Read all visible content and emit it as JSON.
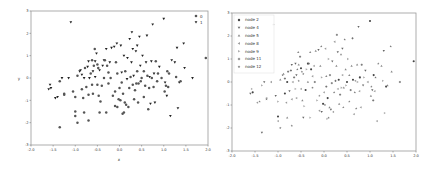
{
  "chart_data": [
    {
      "type": "scatter",
      "title": "",
      "xlabel": "x",
      "ylabel": "y",
      "xlim": [
        -2.0,
        2.0
      ],
      "ylim": [
        -3,
        3
      ],
      "xticks": [
        "-2.0",
        "-1.5",
        "-1.0",
        "-0.5",
        "0.0",
        "0.5",
        "1.0",
        "1.5",
        "2.0"
      ],
      "yticks": [
        "-3",
        "-2",
        "-1",
        "0",
        "1",
        "2",
        "3"
      ],
      "grid": false,
      "legend_position": "upper right",
      "series": [
        {
          "name": "0",
          "marker": "circle",
          "color": "#555555"
        },
        {
          "name": "1",
          "marker": "triangle-down",
          "color": "#222222"
        }
      ]
    },
    {
      "type": "scatter",
      "title": "",
      "xlabel": "",
      "ylabel": "",
      "xlim": [
        -2.0,
        2.0
      ],
      "ylim": [
        -3,
        3
      ],
      "xticks": [
        "-2.0",
        "-1.5",
        "-1.0",
        "-0.5",
        "0.0",
        "0.5",
        "1.0",
        "1.5",
        "2.0"
      ],
      "yticks": [
        "-3",
        "-2",
        "-1",
        "0",
        "1",
        "2",
        "3"
      ],
      "grid": false,
      "legend_position": "upper left",
      "series": [
        {
          "name": "node 2",
          "marker": "circle",
          "color": "#444444"
        },
        {
          "name": "node 4",
          "marker": "triangle-down",
          "color": "#666666"
        },
        {
          "name": "node 5",
          "marker": "triangle-up",
          "color": "#888888"
        },
        {
          "name": "node 8",
          "marker": "triangle-left",
          "color": "#999999"
        },
        {
          "name": "node 9",
          "marker": "triangle-right",
          "color": "#aaaaaa"
        },
        {
          "name": "node 11",
          "marker": "plus",
          "color": "#666666"
        },
        {
          "name": "node 12",
          "marker": "star",
          "color": "#777777"
        }
      ]
    }
  ],
  "points": [
    [
      -1.6,
      -0.5,
      1
    ],
    [
      -1.57,
      -0.3,
      1
    ],
    [
      -1.55,
      -0.45,
      1
    ],
    [
      -1.45,
      -0.9,
      1
    ],
    [
      -1.4,
      -0.85,
      1
    ],
    [
      -1.35,
      -2.2,
      0
    ],
    [
      -1.35,
      -0.15,
      0
    ],
    [
      -1.3,
      0.0,
      1
    ],
    [
      -1.25,
      -0.7,
      0
    ],
    [
      -1.25,
      -0.75,
      0
    ],
    [
      -1.15,
      -0.0,
      1
    ],
    [
      -1.1,
      2.5,
      1
    ],
    [
      -1.05,
      -0.6,
      0
    ],
    [
      -1.0,
      -0.85,
      0
    ],
    [
      -1.0,
      -1.5,
      0
    ],
    [
      -1.0,
      -1.7,
      0
    ],
    [
      -0.95,
      -2.0,
      0
    ],
    [
      -0.95,
      0.1,
      0
    ],
    [
      -0.9,
      0.3,
      1
    ],
    [
      -0.88,
      0.35,
      1
    ],
    [
      -0.85,
      0.15,
      1
    ],
    [
      -0.85,
      -0.5,
      0
    ],
    [
      -0.82,
      -0.9,
      0
    ],
    [
      -0.8,
      0.0,
      1
    ],
    [
      -0.8,
      -1.55,
      0
    ],
    [
      -0.78,
      0.45,
      0
    ],
    [
      -0.75,
      -0.4,
      0
    ],
    [
      -0.72,
      0.5,
      1
    ],
    [
      -0.7,
      0.75,
      1
    ],
    [
      -0.7,
      -0.75,
      0
    ],
    [
      -0.7,
      -1.9,
      0
    ],
    [
      -0.68,
      0.0,
      1
    ],
    [
      -0.65,
      0.2,
      0
    ],
    [
      -0.62,
      0.8,
      0
    ],
    [
      -0.62,
      -0.3,
      0
    ],
    [
      -0.6,
      0.3,
      1
    ],
    [
      -0.6,
      -0.7,
      0
    ],
    [
      -0.58,
      0.55,
      0
    ],
    [
      -0.56,
      1.3,
      0
    ],
    [
      -0.55,
      0.05,
      1
    ],
    [
      -0.55,
      0.75,
      1
    ],
    [
      -0.52,
      1.1,
      1
    ],
    [
      -0.5,
      0.6,
      0
    ],
    [
      -0.5,
      -0.3,
      0
    ],
    [
      -0.48,
      0.45,
      0
    ],
    [
      -0.47,
      -0.8,
      0
    ],
    [
      -0.45,
      0.35,
      1
    ],
    [
      -0.45,
      -1.55,
      0
    ],
    [
      -0.43,
      -1.05,
      0
    ],
    [
      -0.4,
      -0.35,
      0
    ],
    [
      -0.38,
      0.55,
      1
    ],
    [
      -0.35,
      0.8,
      1
    ],
    [
      -0.35,
      0.0,
      0
    ],
    [
      -0.33,
      0.8,
      0
    ],
    [
      -0.3,
      1.3,
      1
    ],
    [
      -0.3,
      -1.55,
      0
    ],
    [
      -0.28,
      0.55,
      0
    ],
    [
      -0.25,
      0.25,
      0
    ],
    [
      -0.25,
      -0.25,
      0
    ],
    [
      -0.22,
      0.7,
      1
    ],
    [
      -0.2,
      0.0,
      0
    ],
    [
      -0.18,
      1.35,
      1
    ],
    [
      -0.15,
      -0.8,
      0
    ],
    [
      -0.12,
      1.4,
      1
    ],
    [
      -0.1,
      -1.25,
      0
    ],
    [
      -0.1,
      -0.6,
      0
    ],
    [
      -0.08,
      0.7,
      0
    ],
    [
      -0.06,
      1.55,
      1
    ],
    [
      -0.05,
      -1.3,
      0
    ],
    [
      -0.05,
      0.2,
      0
    ],
    [
      -0.02,
      -0.95,
      0
    ],
    [
      0.0,
      -0.45,
      0
    ],
    [
      0.02,
      -1.0,
      0
    ],
    [
      0.03,
      1.45,
      1
    ],
    [
      0.05,
      -0.2,
      0
    ],
    [
      0.05,
      0.25,
      1
    ],
    [
      0.07,
      -1.6,
      0
    ],
    [
      0.08,
      -0.7,
      0
    ],
    [
      0.1,
      1.0,
      1
    ],
    [
      0.1,
      -1.55,
      0
    ],
    [
      0.12,
      -1.1,
      0
    ],
    [
      0.13,
      0.3,
      0
    ],
    [
      0.15,
      -1.2,
      0
    ],
    [
      0.17,
      -0.05,
      1
    ],
    [
      0.18,
      0.9,
      1
    ],
    [
      0.2,
      -1.3,
      0
    ],
    [
      0.22,
      -0.45,
      0
    ],
    [
      0.23,
      1.75,
      1
    ],
    [
      0.25,
      0.05,
      0
    ],
    [
      0.27,
      0.7,
      1
    ],
    [
      0.28,
      2.05,
      1
    ],
    [
      0.3,
      1.3,
      1
    ],
    [
      0.3,
      -0.3,
      0
    ],
    [
      0.32,
      0.1,
      1
    ],
    [
      0.33,
      -0.95,
      0
    ],
    [
      0.35,
      -0.55,
      0
    ],
    [
      0.37,
      1.2,
      1
    ],
    [
      0.38,
      -0.25,
      0
    ],
    [
      0.4,
      1.45,
      1
    ],
    [
      0.4,
      0.3,
      0
    ],
    [
      0.42,
      -1.1,
      0
    ],
    [
      0.43,
      -0.25,
      0
    ],
    [
      0.45,
      1.85,
      1
    ],
    [
      0.47,
      0.55,
      1
    ],
    [
      0.48,
      -0.15,
      0
    ],
    [
      0.5,
      0.0,
      0
    ],
    [
      0.52,
      1.0,
      1
    ],
    [
      0.55,
      -0.85,
      0
    ],
    [
      0.55,
      0.3,
      0
    ],
    [
      0.58,
      -0.35,
      0
    ],
    [
      0.6,
      0.7,
      1
    ],
    [
      0.62,
      1.9,
      1
    ],
    [
      0.63,
      0.1,
      0
    ],
    [
      0.65,
      -1.4,
      0
    ],
    [
      0.67,
      -0.45,
      0
    ],
    [
      0.68,
      0.05,
      1
    ],
    [
      0.7,
      -1.15,
      1
    ],
    [
      0.72,
      0.75,
      1
    ],
    [
      0.73,
      0.0,
      0
    ],
    [
      0.75,
      2.4,
      1
    ],
    [
      0.77,
      -0.4,
      0
    ],
    [
      0.78,
      0.2,
      1
    ],
    [
      0.8,
      -1.1,
      1
    ],
    [
      0.82,
      0.75,
      0
    ],
    [
      0.85,
      -0.15,
      0
    ],
    [
      0.87,
      0.2,
      0
    ],
    [
      0.9,
      0.5,
      1
    ],
    [
      0.95,
      0.0,
      0
    ],
    [
      1.0,
      2.65,
      1
    ],
    [
      1.02,
      -0.6,
      0
    ],
    [
      1.03,
      -0.2,
      1
    ],
    [
      1.05,
      -0.35,
      0
    ],
    [
      1.07,
      -0.8,
      1
    ],
    [
      1.08,
      0.3,
      0
    ],
    [
      1.1,
      -0.4,
      0
    ],
    [
      1.12,
      0.2,
      0
    ],
    [
      1.15,
      -1.7,
      1
    ],
    [
      1.18,
      0.8,
      1
    ],
    [
      1.25,
      0.7,
      1
    ],
    [
      1.28,
      0.05,
      0
    ],
    [
      1.3,
      1.35,
      1
    ],
    [
      1.32,
      -1.35,
      1
    ],
    [
      1.35,
      -0.2,
      1
    ],
    [
      1.38,
      -0.15,
      0
    ],
    [
      1.45,
      1.55,
      1
    ],
    [
      1.47,
      0.45,
      1
    ],
    [
      1.65,
      0.0,
      1
    ],
    [
      1.95,
      0.9,
      0
    ]
  ],
  "node_for_point_rule": "node index cycles through legend entries",
  "legend_left": [
    {
      "label": "0"
    },
    {
      "label": "1"
    }
  ],
  "legend_right": [
    {
      "label": "node 2"
    },
    {
      "label": "node 4"
    },
    {
      "label": "node 5"
    },
    {
      "label": "node 8"
    },
    {
      "label": "node 9"
    },
    {
      "label": "node 11"
    },
    {
      "label": "node 12"
    }
  ],
  "axes": {
    "left": {
      "xlabel": "x",
      "ylabel": "y"
    }
  }
}
